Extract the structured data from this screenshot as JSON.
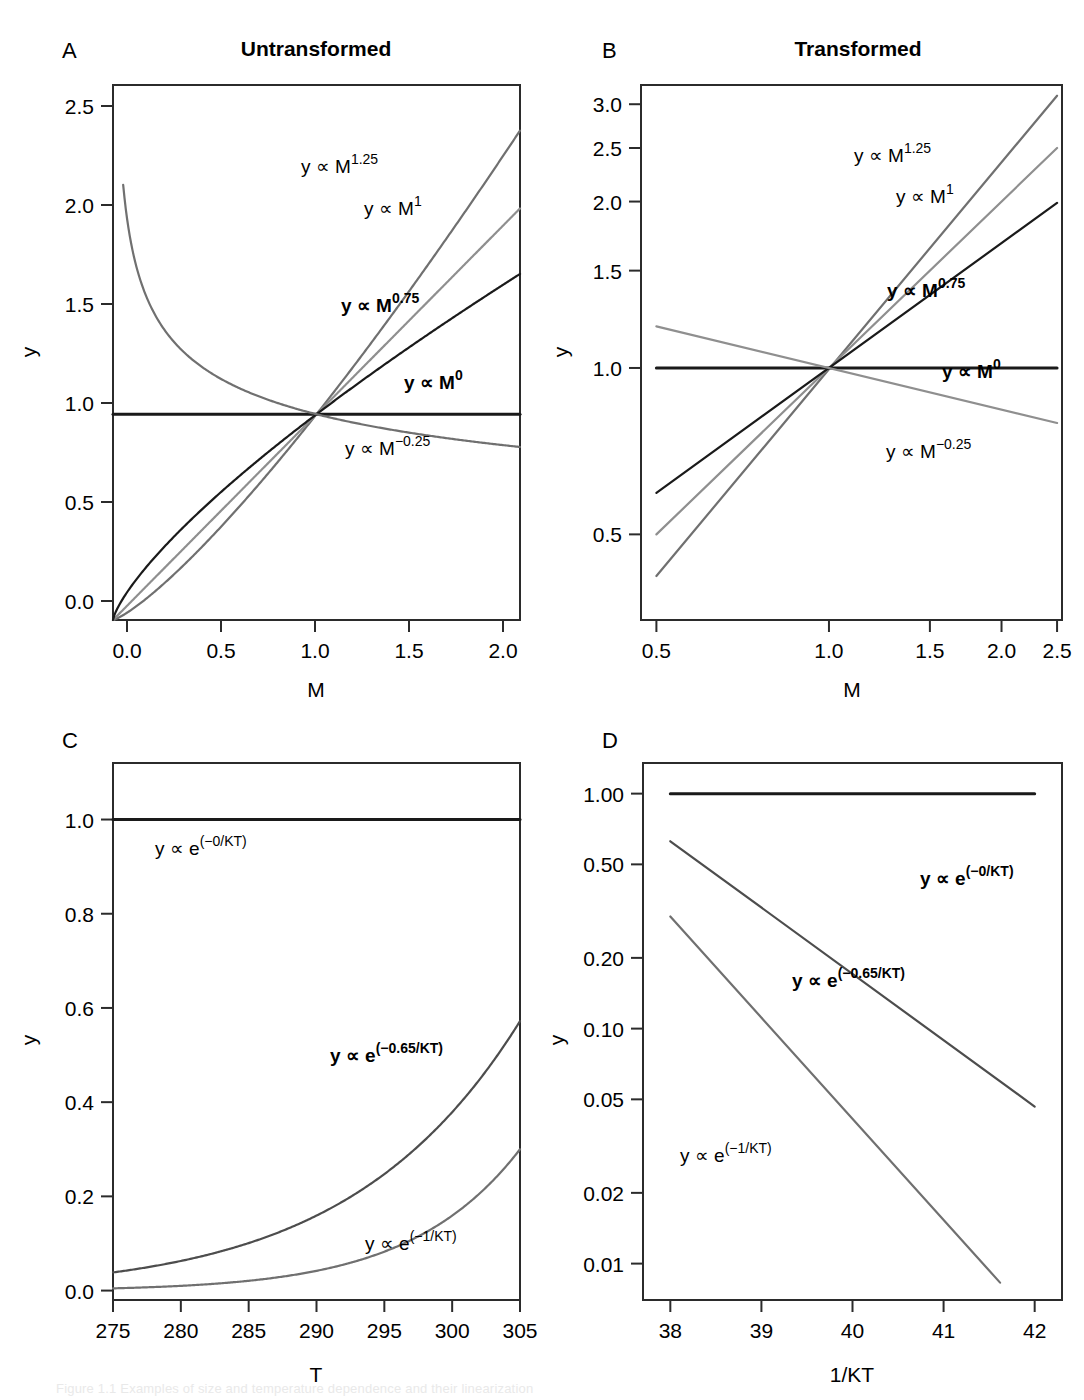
{
  "figure": {
    "width": 1084,
    "height": 1400,
    "background": "#ffffff",
    "caption_partial": "Figure 1.1 Examples of size and temperature dependence and their linearization"
  },
  "colors": {
    "black": "#1a1a1a",
    "dark_gray": "#4d4d4d",
    "mid_gray": "#707070",
    "light_gray": "#8f8f8f",
    "pale_gray": "#a6a6a6",
    "axis": "#2b2b2b"
  },
  "panels": [
    {
      "letter": "A",
      "title": "Untransformed",
      "xlabel": "M",
      "ylabel": "y",
      "xticks": [
        "0.0",
        "0.5",
        "1.0",
        "1.5",
        "2.0"
      ],
      "yticks": [
        "0.0",
        "0.5",
        "1.0",
        "1.5",
        "2.0",
        "2.5"
      ],
      "labels": [
        {
          "text": "y ∝ M",
          "sup": "1.25"
        },
        {
          "text": "y ∝ M",
          "sup": "1"
        },
        {
          "text": "y ∝ M",
          "sup": "0.75"
        },
        {
          "text": "y ∝ M",
          "sup": "0"
        },
        {
          "text": "y ∝ M",
          "sup": "−0.25"
        }
      ]
    },
    {
      "letter": "B",
      "title": "Transformed",
      "xlabel": "M",
      "ylabel": "y",
      "xticks": [
        "0.5",
        "1.0",
        "1.5",
        "2.0",
        "2.5"
      ],
      "yticks": [
        "0.5",
        "1.0",
        "1.5",
        "2.0",
        "2.5",
        "3.0"
      ],
      "labels": [
        {
          "text": "y ∝ M",
          "sup": "1.25"
        },
        {
          "text": "y ∝ M",
          "sup": "1"
        },
        {
          "text": "y ∝ M",
          "sup": "0.75"
        },
        {
          "text": "y ∝ M",
          "sup": "0"
        },
        {
          "text": "y ∝ M",
          "sup": "−0.25"
        }
      ]
    },
    {
      "letter": "C",
      "title": "",
      "xlabel": "T",
      "ylabel": "y",
      "xticks": [
        "275",
        "280",
        "285",
        "290",
        "295",
        "300",
        "305"
      ],
      "yticks": [
        "0.0",
        "0.2",
        "0.4",
        "0.6",
        "0.8",
        "1.0"
      ],
      "labels": [
        {
          "text": "y ∝ e",
          "sup": "(−0/KT)"
        },
        {
          "text": "y ∝ e",
          "sup": "(−0.65/KT)"
        },
        {
          "text": "y ∝ e",
          "sup": "(−1/KT)"
        }
      ]
    },
    {
      "letter": "D",
      "title": "",
      "xlabel": "1/KT",
      "ylabel": "y",
      "xticks": [
        "38",
        "39",
        "40",
        "41",
        "42"
      ],
      "yticks": [
        "0.01",
        "0.02",
        "0.05",
        "0.10",
        "0.20",
        "0.50",
        "1.00"
      ],
      "labels": [
        {
          "text": "y ∝ e",
          "sup": "(−0/KT)"
        },
        {
          "text": "y ∝ e",
          "sup": "(−0.65/KT)"
        },
        {
          "text": "y ∝ e",
          "sup": "(−1/KT)"
        }
      ]
    }
  ],
  "chart_data": [
    {
      "id": "panel-a",
      "type": "line",
      "title": "Untransformed",
      "xlabel": "M",
      "ylabel": "y",
      "xscale": "linear",
      "yscale": "linear",
      "xlim": [
        0.0,
        2.0
      ],
      "ylim": [
        0.0,
        2.6
      ],
      "xticks": [
        0.0,
        0.5,
        1.0,
        1.5,
        2.0
      ],
      "yticks": [
        0.0,
        0.5,
        1.0,
        1.5,
        2.0,
        2.5
      ],
      "grid": false,
      "legend": "inline-annotations",
      "series": [
        {
          "name": "y ∝ M^1.25",
          "exponent": 1.25,
          "color": "#707070",
          "x": [
            0.0,
            0.1,
            0.2,
            0.3,
            0.4,
            0.5,
            0.6,
            0.7,
            0.8,
            0.9,
            1.0,
            1.1,
            1.2,
            1.3,
            1.4,
            1.5,
            1.6,
            1.7,
            1.8,
            1.9,
            2.0
          ],
          "y": [
            0.0,
            0.056,
            0.134,
            0.222,
            0.318,
            0.42,
            0.528,
            0.64,
            0.757,
            0.877,
            1.0,
            1.126,
            1.255,
            1.387,
            1.521,
            1.657,
            1.796,
            1.937,
            2.08,
            2.224,
            2.378
          ]
        },
        {
          "name": "y ∝ M^1",
          "exponent": 1.0,
          "color": "#8f8f8f",
          "x": [
            0.0,
            0.25,
            0.5,
            0.75,
            1.0,
            1.25,
            1.5,
            1.75,
            2.0
          ],
          "y": [
            0.0,
            0.25,
            0.5,
            0.75,
            1.0,
            1.25,
            1.5,
            1.75,
            2.0
          ]
        },
        {
          "name": "y ∝ M^0.75",
          "exponent": 0.75,
          "color": "#1a1a1a",
          "x": [
            0.0,
            0.1,
            0.2,
            0.3,
            0.4,
            0.5,
            0.6,
            0.7,
            0.8,
            0.9,
            1.0,
            1.2,
            1.4,
            1.6,
            1.8,
            2.0
          ],
          "y": [
            0.0,
            0.178,
            0.299,
            0.405,
            0.503,
            0.595,
            0.682,
            0.765,
            0.846,
            0.924,
            1.0,
            1.147,
            1.288,
            1.424,
            1.555,
            1.682
          ]
        },
        {
          "name": "y ∝ M^0",
          "exponent": 0.0,
          "color": "#1a1a1a",
          "x": [
            0.0,
            2.0
          ],
          "y": [
            1.0,
            1.0
          ]
        },
        {
          "name": "y ∝ M^-0.25",
          "exponent": -0.25,
          "color": "#707070",
          "x": [
            0.05,
            0.1,
            0.2,
            0.3,
            0.4,
            0.5,
            0.6,
            0.7,
            0.8,
            0.9,
            1.0,
            1.2,
            1.4,
            1.6,
            1.8,
            2.0
          ],
          "y": [
            2.115,
            1.778,
            1.495,
            1.351,
            1.257,
            1.189,
            1.136,
            1.094,
            1.057,
            1.027,
            1.0,
            0.955,
            0.919,
            0.889,
            0.863,
            0.841
          ]
        }
      ]
    },
    {
      "id": "panel-b",
      "type": "line",
      "title": "Transformed",
      "xlabel": "M",
      "ylabel": "y",
      "xscale": "log",
      "yscale": "log",
      "xlim": [
        0.47,
        2.55
      ],
      "ylim": [
        0.35,
        3.25
      ],
      "xticks": [
        0.5,
        1.0,
        1.5,
        2.0,
        2.5
      ],
      "yticks": [
        0.5,
        1.0,
        1.5,
        2.0,
        2.5,
        3.0
      ],
      "grid": false,
      "legend": "inline-annotations",
      "series": [
        {
          "name": "y ∝ M^1.25",
          "exponent": 1.25,
          "color": "#707070",
          "x": [
            0.5,
            2.5
          ],
          "y": [
            0.4204,
            3.1078
          ]
        },
        {
          "name": "y ∝ M^1",
          "exponent": 1.0,
          "color": "#8f8f8f",
          "x": [
            0.5,
            2.5
          ],
          "y": [
            0.5,
            2.5
          ]
        },
        {
          "name": "y ∝ M^0.75",
          "exponent": 0.75,
          "color": "#1a1a1a",
          "x": [
            0.5,
            2.5
          ],
          "y": [
            0.5946,
            1.9887
          ]
        },
        {
          "name": "y ∝ M^0",
          "exponent": 0.0,
          "color": "#1a1a1a",
          "x": [
            0.5,
            2.5
          ],
          "y": [
            1.0,
            1.0
          ]
        },
        {
          "name": "y ∝ M^-0.25",
          "exponent": -0.25,
          "color": "#8f8f8f",
          "x": [
            0.5,
            2.5
          ],
          "y": [
            1.1892,
            0.7953
          ]
        }
      ]
    },
    {
      "id": "panel-c",
      "type": "line",
      "title": "",
      "xlabel": "T",
      "ylabel": "y",
      "xscale": "linear",
      "yscale": "linear",
      "xlim": [
        275,
        305
      ],
      "ylim": [
        -0.02,
        1.12
      ],
      "xticks": [
        275,
        280,
        285,
        290,
        295,
        300,
        305
      ],
      "yticks": [
        0.0,
        0.2,
        0.4,
        0.6,
        0.8,
        1.0
      ],
      "grid": false,
      "legend": "inline-annotations",
      "series": [
        {
          "name": "y ∝ e^(-0/KT)",
          "Ea": 0.0,
          "color": "#1a1a1a",
          "x": [
            275,
            305
          ],
          "y": [
            1.0,
            1.0
          ]
        },
        {
          "name": "y ∝ e^(-0.65/KT)",
          "Ea": 0.65,
          "color": "#4d4d4d",
          "x": [
            275,
            280,
            285,
            290,
            295,
            300,
            305
          ],
          "y": [
            0.038,
            0.059,
            0.09,
            0.135,
            0.198,
            0.286,
            0.572
          ]
        },
        {
          "name": "y ∝ e^(-1/KT)",
          "Ea": 1.0,
          "color": "#707070",
          "x": [
            275,
            280,
            285,
            290,
            295,
            300,
            305
          ],
          "y": [
            0.006,
            0.011,
            0.02,
            0.036,
            0.063,
            0.109,
            0.3
          ]
        }
      ]
    },
    {
      "id": "panel-d",
      "type": "line",
      "title": "",
      "xlabel": "1/KT",
      "ylabel": "y",
      "xscale": "linear",
      "yscale": "log",
      "xlim": [
        37.7,
        42.3
      ],
      "ylim": [
        0.007,
        1.35
      ],
      "xticks": [
        38,
        39,
        40,
        41,
        42
      ],
      "yticks": [
        0.01,
        0.02,
        0.05,
        0.1,
        0.2,
        0.5,
        1.0
      ],
      "grid": false,
      "legend": "inline-annotations",
      "series": [
        {
          "name": "y ∝ e^(-0/KT)",
          "Ea": 0.0,
          "color": "#1a1a1a",
          "x": [
            38,
            42
          ],
          "y": [
            1.0,
            1.0
          ]
        },
        {
          "name": "y ∝ e^(-0.65/KT)",
          "Ea": 0.65,
          "color": "#4d4d4d",
          "x": [
            38,
            42
          ],
          "y": [
            0.627,
            0.0466
          ]
        },
        {
          "name": "y ∝ e^(-1/KT)",
          "Ea": 1.0,
          "color": "#707070",
          "x": [
            38,
            41.62
          ],
          "y": [
            0.3,
            0.0083
          ]
        }
      ]
    }
  ]
}
